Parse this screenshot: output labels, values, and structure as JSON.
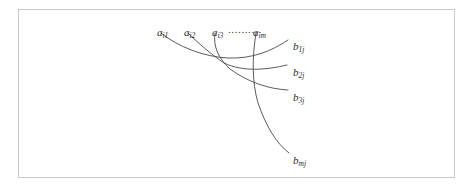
{
  "figure": {
    "kind": "bipartite-arc-diagram",
    "border_color": "#c9c9c9",
    "background_color": "#ffffff",
    "curve_color": "#4a4a4a",
    "text_color": "#2b2b2b"
  },
  "source_nodes": [
    {
      "id": "a-i1",
      "base": "a",
      "sub": "i1",
      "x": 157,
      "y": 27
    },
    {
      "id": "a-i2",
      "base": "a",
      "sub": "i2",
      "x": 184,
      "y": 27
    },
    {
      "id": "a-i3",
      "base": "a",
      "sub": "i3",
      "x": 212,
      "y": 27
    },
    {
      "id": "a-im",
      "base": "a",
      "sub": "im",
      "x": 253,
      "y": 27
    }
  ],
  "leader": {
    "dots": "..........",
    "x": 228,
    "y": 24,
    "from": "a-i3",
    "to": "a-im"
  },
  "target_nodes": [
    {
      "id": "b-1j",
      "base": "b",
      "sub": "1j",
      "x": 293,
      "y": 41
    },
    {
      "id": "b-2j",
      "base": "b",
      "sub": "2j",
      "x": 293,
      "y": 67
    },
    {
      "id": "b-3j",
      "base": "b",
      "sub": "3j",
      "x": 293,
      "y": 92
    },
    {
      "id": "b-mj",
      "base": "b",
      "sub": "mj",
      "x": 293,
      "y": 155
    }
  ],
  "edges": [
    {
      "id": "edge-a-i1-to-b-1j",
      "from": "a-i1",
      "to": "b-1j",
      "path": "M 161 33 C 178 47, 205 57, 228 58 C 252 59, 272 51, 288 40"
    },
    {
      "id": "edge-a-i2-to-b-2j",
      "from": "a-i2",
      "to": "b-2j",
      "path": "M 188 33 C 198 43, 212 55, 224 63 C 243 72, 266 70, 287 65"
    },
    {
      "id": "edge-a-i3-to-b-3j",
      "from": "a-i3",
      "to": "b-3j",
      "path": "M 215 33 C 213 46, 218 58, 230 69 C 248 82, 268 89, 288 90"
    },
    {
      "id": "edge-a-im-to-b-mj",
      "from": "a-im",
      "to": "b-mj",
      "path": "M 256 33 C 252 58, 252 82, 258 103 C 266 126, 276 143, 289 153"
    }
  ]
}
